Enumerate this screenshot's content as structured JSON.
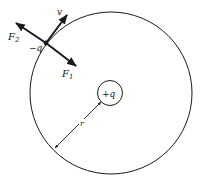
{
  "diagram": {
    "type": "charge orbit force diagram",
    "labels": {
      "velocity": "v",
      "force_outward": "F",
      "force_outward_sub": "2",
      "force_inward": "F",
      "force_inward_sub": "1",
      "orbiting_charge": "−q",
      "central_charge": "+q",
      "radius": "r"
    },
    "colors": {
      "stroke": "#1a1a1a",
      "background": "#ffffff"
    }
  }
}
